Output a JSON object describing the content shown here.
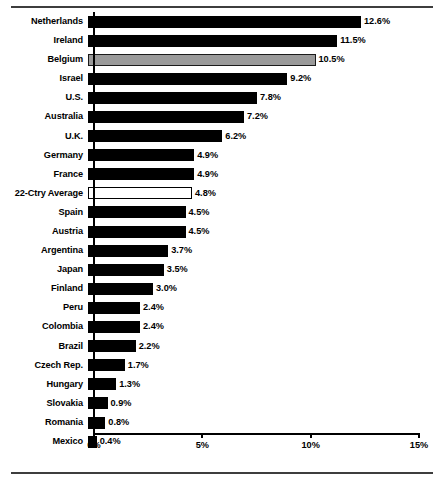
{
  "chart_data": {
    "type": "bar",
    "orientation": "horizontal",
    "title": "",
    "subtitle": "",
    "xlabel": "",
    "ylabel": "",
    "xlim": [
      0,
      15
    ],
    "xticks": [
      "0%",
      "5%",
      "10%",
      "15%"
    ],
    "xtick_values": [
      0,
      5,
      10,
      15
    ],
    "grid": false,
    "legend": [],
    "categories": [
      "Netherlands",
      "Ireland",
      "Belgium",
      "Israel",
      "U.S.",
      "Australia",
      "U.K.",
      "Germany",
      "France",
      "22-Ctry Average",
      "Spain",
      "Austria",
      "Argentina",
      "Japan",
      "Finland",
      "Peru",
      "Colombia",
      "Brazil",
      "Czech Rep.",
      "Hungary",
      "Slovakia",
      "Romania",
      "Mexico"
    ],
    "values": [
      12.6,
      11.5,
      10.5,
      9.2,
      7.8,
      7.2,
      6.2,
      4.9,
      4.9,
      4.8,
      4.5,
      4.5,
      3.7,
      3.5,
      3.0,
      2.4,
      2.4,
      2.2,
      1.7,
      1.3,
      0.9,
      0.8,
      0.4
    ],
    "data_labels": [
      "12.6%",
      "11.5%",
      "10.5%",
      "9.2%",
      "7.8%",
      "7.2%",
      "6.2%",
      "4.9%",
      "4.9%",
      "4.8%",
      "4.5%",
      "4.5%",
      "3.7%",
      "3.5%",
      "3.0%",
      "2.4%",
      "2.4%",
      "2.2%",
      "1.7%",
      "1.3%",
      "0.9%",
      "0.8%",
      "0.4%"
    ],
    "bar_styles": [
      "black",
      "black",
      "gray",
      "black",
      "black",
      "black",
      "black",
      "black",
      "black",
      "hollow",
      "black",
      "black",
      "black",
      "black",
      "black",
      "black",
      "black",
      "black",
      "black",
      "black",
      "black",
      "black",
      "black"
    ],
    "colors": {
      "bar_default": "#000000",
      "bar_highlight": "#9a9a9a",
      "bar_average": "#ffffff",
      "axis": "#000000",
      "rule": "#3d3d3d",
      "background": "#ffffff"
    }
  }
}
